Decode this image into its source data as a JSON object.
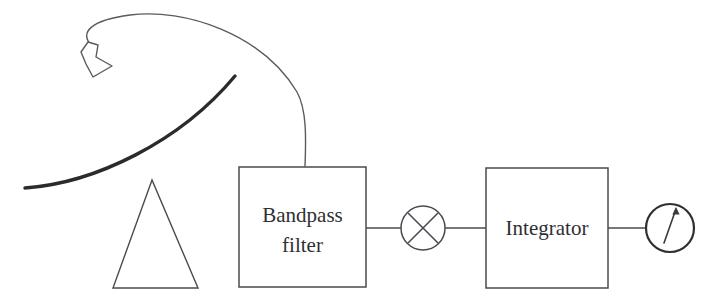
{
  "diagram": {
    "type": "signal-flow-block-diagram",
    "stroke_color": "#4a4a50",
    "dish_stroke_color": "#2b2b2e",
    "background_color": "#ffffff",
    "canvas": {
      "width": 718,
      "height": 305
    }
  },
  "antenna": {
    "name": "parabolic-dish-antenna",
    "dish": {
      "label": "reflector-dish",
      "start": [
        25,
        188
      ],
      "control": [
        120,
        170
      ],
      "end": [
        235,
        76
      ],
      "stroke_width": 3.2
    },
    "stand": {
      "label": "tripod-stand",
      "apex": [
        152,
        180
      ],
      "base_left": [
        113,
        288
      ],
      "base_right": [
        198,
        288
      ],
      "stroke_width": 1.3
    },
    "feed_horn": {
      "label": "feed-horn",
      "position": [
        85,
        50
      ],
      "stroke_width": 1.3
    },
    "cable": {
      "label": "feed-cable",
      "from": [
        92,
        46
      ],
      "to": [
        305,
        166
      ],
      "stroke_width": 1.3
    }
  },
  "blocks": [
    {
      "id": "bandpass-filter",
      "label_lines": [
        "Bandpass",
        "filter"
      ],
      "shape": "rect",
      "x": 239,
      "y": 167,
      "width": 127,
      "height": 120
    },
    {
      "id": "integrator",
      "label_lines": [
        "Integrator"
      ],
      "shape": "rect",
      "x": 486,
      "y": 168,
      "width": 122,
      "height": 120
    }
  ],
  "multiplier": {
    "id": "square-law-multiplier",
    "label": "multiply",
    "symbol": "X",
    "cx": 423,
    "cy": 228,
    "r": 22
  },
  "meter": {
    "id": "output-meter",
    "label": "meter",
    "cx": 670,
    "cy": 228,
    "r": 24,
    "needle_angle_deg": 20
  },
  "connectors": [
    {
      "id": "filter-to-multiplier",
      "x1": 366,
      "y1": 228,
      "x2": 401,
      "y2": 228
    },
    {
      "id": "multiplier-to-integrator",
      "x1": 445,
      "y1": 228,
      "x2": 486,
      "y2": 228
    },
    {
      "id": "integrator-to-meter",
      "x1": 608,
      "y1": 228,
      "x2": 646,
      "y2": 228
    }
  ]
}
